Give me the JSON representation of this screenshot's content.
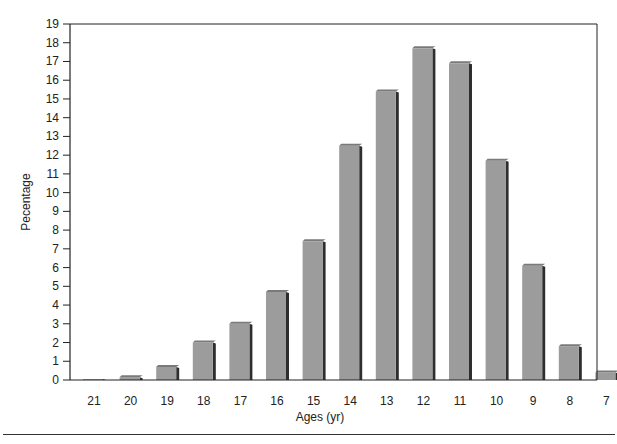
{
  "chart_data": {
    "type": "bar",
    "title": "",
    "xlabel": "Ages (yr)",
    "ylabel": "Pecentage",
    "ylim": [
      0,
      19
    ],
    "yticks": [
      0,
      1,
      2,
      3,
      4,
      5,
      6,
      7,
      8,
      9,
      10,
      11,
      12,
      13,
      14,
      15,
      16,
      17,
      18,
      19
    ],
    "grid": false,
    "legend": null,
    "style": "3d-shaded",
    "categories": [
      "21",
      "20",
      "19",
      "18",
      "17",
      "16",
      "15",
      "14",
      "13",
      "12",
      "11",
      "10",
      "9",
      "8",
      "7"
    ],
    "values": [
      0.05,
      0.15,
      0.7,
      2.0,
      3.0,
      4.7,
      7.4,
      12.5,
      15.4,
      17.7,
      16.9,
      11.7,
      6.1,
      1.8,
      0.4
    ]
  },
  "colors": {
    "bar_face": "#9c9c9c",
    "bar_top": "#7a7a7a",
    "bar_side": "#2e2e2e",
    "axis": "#222222"
  }
}
